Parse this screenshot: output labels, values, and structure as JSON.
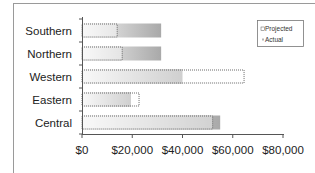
{
  "chart_data": {
    "type": "bar",
    "orientation": "horizontal",
    "title": "",
    "xlabel": "",
    "ylabel": "",
    "categories": [
      "Southern",
      "Northern",
      "Western",
      "Eastern",
      "Central"
    ],
    "series": [
      {
        "name": "Projected",
        "values": [
          14000,
          16000,
          64500,
          22700,
          52000
        ],
        "style": "dotted-outline-light"
      },
      {
        "name": "Actual",
        "values": [
          31500,
          31500,
          40000,
          19500,
          55000
        ],
        "style": "gray-gradient"
      }
    ],
    "xlim": [
      0,
      80000
    ],
    "x_ticks": [
      0,
      20000,
      40000,
      60000,
      80000
    ],
    "x_tick_labels": [
      "$0",
      "$20,000",
      "$40,000",
      "$60,000",
      "$80,000"
    ],
    "grid": false,
    "legend": {
      "position": "top-right",
      "entries": [
        "Projected",
        "Actual"
      ]
    }
  },
  "colors": {
    "frame": "#9a9a9a",
    "axis": "#555555",
    "actual_dark": "#a9a9a9",
    "actual_light": "#f4f4f4",
    "projected_outline": "#6a6a6a",
    "projected_fill": "#ffffff"
  }
}
